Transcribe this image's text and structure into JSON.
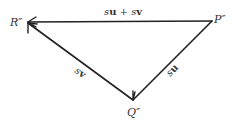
{
  "diagram": {
    "type": "vector-triangle",
    "points": {
      "R": {
        "label": "R″",
        "x": 27,
        "y": 22
      },
      "P": {
        "label": "P″",
        "x": 212,
        "y": 21
      },
      "Q": {
        "label": "Q″",
        "x": 133,
        "y": 101
      }
    },
    "edges": [
      {
        "from": "P",
        "to": "R",
        "label_s": "s",
        "label_u": "u",
        "label_plus": " + ",
        "label_s2": "s",
        "label_v": "v"
      },
      {
        "from": "Q",
        "to": "R",
        "label_s": "s",
        "label_v": "v"
      },
      {
        "from": "P",
        "to": "Q",
        "label_s": "s",
        "label_u": "u"
      }
    ],
    "colors": {
      "line": "#222222",
      "text": "#333333",
      "background": "#ffffff"
    }
  }
}
